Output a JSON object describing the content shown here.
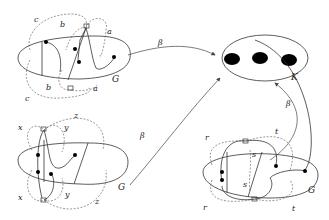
{
  "diagram": {
    "target": {
      "label": "K",
      "dots": 3
    },
    "graphs": [
      {
        "id": "top-left",
        "label": "G",
        "curve_labels": [
          "a",
          "a",
          "b",
          "b",
          "c",
          "c"
        ]
      },
      {
        "id": "bottom-left",
        "label": "G",
        "curve_labels": [
          "x",
          "x",
          "y",
          "y",
          "z",
          "z"
        ]
      },
      {
        "id": "bottom-right",
        "label": "G",
        "curve_labels": [
          "r",
          "r",
          "s",
          "s",
          "t",
          "t"
        ]
      }
    ],
    "maps": [
      {
        "from": "top-left",
        "to": "K",
        "label": "β"
      },
      {
        "from": "bottom-left",
        "to": "K",
        "label": "β"
      },
      {
        "from": "bottom-right",
        "to": "K",
        "label": "β"
      }
    ]
  },
  "labels": {
    "K": "K",
    "G": "G",
    "beta": "β",
    "a": "a",
    "b": "b",
    "c": "c",
    "x": "x",
    "y": "y",
    "z": "z",
    "r": "r",
    "s": "s",
    "t": "t"
  }
}
